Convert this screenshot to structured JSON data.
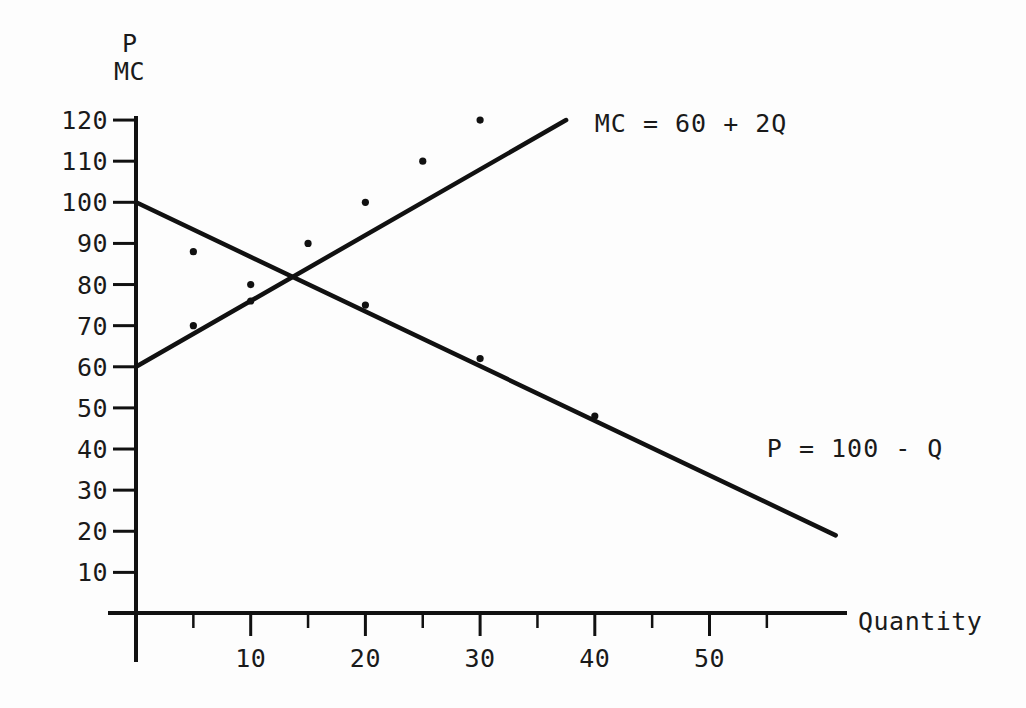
{
  "chart_data": {
    "type": "line",
    "title": "",
    "subtitle": "",
    "xlabel": "Quantity",
    "ylabel_line1": "P",
    "ylabel_line2": "MC",
    "xlim": [
      0,
      62
    ],
    "ylim": [
      0,
      125
    ],
    "x_ticks_major": [
      10,
      20,
      30,
      40,
      50
    ],
    "x_ticks_minor": [
      5,
      15,
      25,
      35,
      45,
      55
    ],
    "x_tick_labels": [
      "10",
      "20",
      "30",
      "40",
      "50"
    ],
    "y_ticks": [
      10,
      20,
      30,
      40,
      50,
      60,
      70,
      80,
      90,
      100,
      110,
      120
    ],
    "y_tick_labels": [
      "10",
      "20",
      "30",
      "40",
      "50",
      "60",
      "70",
      "80",
      "90",
      "100",
      "110",
      "120"
    ],
    "grid": false,
    "legend_position": "inline-annotation",
    "series": [
      {
        "name": "MC = 60 + 2Q",
        "label": "MC = 60 + 2Q",
        "equation": "MC = 60 + 2Q",
        "intercept": 60,
        "slope": 2,
        "color": "#111111",
        "x": [
          0,
          5,
          10,
          15,
          20,
          25,
          30,
          37.5
        ],
        "values": [
          60,
          70,
          80,
          90,
          100,
          110,
          120,
          135
        ],
        "x_drawn": [
          0,
          37.5
        ],
        "y_drawn": [
          60,
          120
        ],
        "markers_x": [
          5,
          10,
          15,
          20,
          25,
          30
        ],
        "markers_y": [
          70,
          80,
          90,
          100,
          110,
          120
        ],
        "label_x": 40,
        "label_y": 117
      },
      {
        "name": "P = 100 - Q",
        "label": "P = 100 - Q",
        "equation": "P = 100 - Q",
        "intercept": 100,
        "slope": -1,
        "color": "#111111",
        "x": [
          0,
          10,
          20,
          30,
          40,
          50,
          60
        ],
        "values": [
          100,
          90,
          80,
          70,
          60,
          50,
          40
        ],
        "x_drawn": [
          0,
          61
        ],
        "y_drawn": [
          100,
          19
        ],
        "markers_x": [
          5,
          10,
          20,
          30,
          40
        ],
        "markers_y": [
          88,
          76,
          75,
          62,
          48
        ],
        "label_x": 55,
        "label_y": 38
      }
    ],
    "intersection": {
      "x": 13.3,
      "y": 86.7
    },
    "annotations": [
      {
        "text": "MC = 60 + 2Q",
        "x": 40,
        "y": 117
      },
      {
        "text": "P = 100 - Q",
        "x": 55,
        "y": 38
      }
    ]
  },
  "axis_titles": {
    "y_top": "P",
    "y_bottom": "MC",
    "x": "Quantity"
  }
}
